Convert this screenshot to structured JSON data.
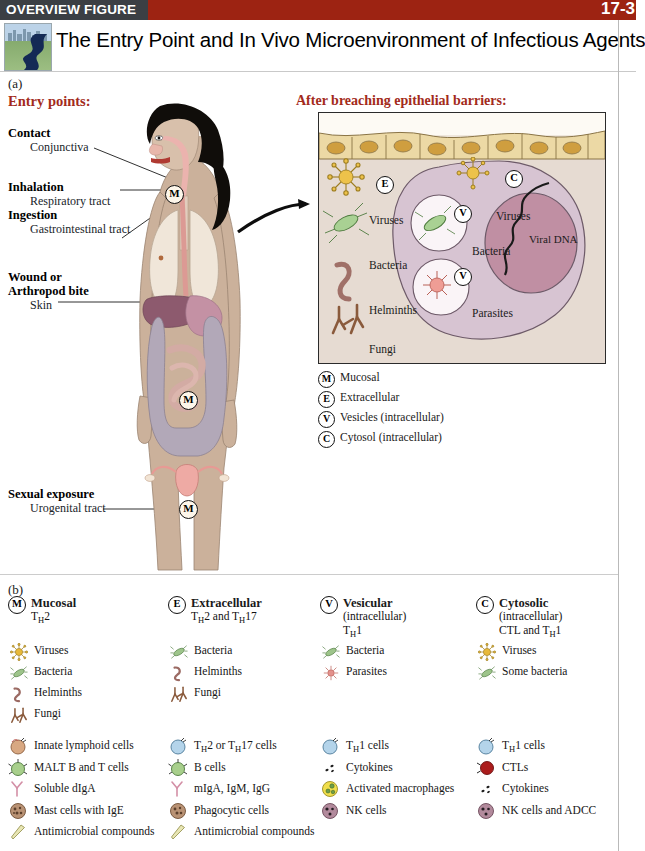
{
  "header": {
    "kicker": "OVERVIEW FIGURE",
    "page_number": "17-3",
    "title": "The Entry Point and In Vivo Microenvironment of Infectious Agents",
    "bar_color": "#9d2312",
    "kicker_block_color": "#3b3f44",
    "accent_red": "#a32b1b"
  },
  "panel_a": {
    "label": "(a)",
    "entry_heading": "Entry points:",
    "breach_heading": "After breaching epithelial barriers:",
    "entry_points": [
      {
        "bold": "Contact",
        "sub": "Conjunctiva"
      },
      {
        "bold": "Inhalation",
        "sub": "Respiratory tract"
      },
      {
        "bold": "Ingestion",
        "sub": "Gastrointestinal tract"
      },
      {
        "bold": "Wound or",
        "bold2": "Arthropod bite",
        "sub": "Skin"
      },
      {
        "bold": "Sexual exposure",
        "sub": "Urogenital tract"
      }
    ],
    "body_markers": [
      "M",
      "M",
      "M"
    ],
    "micrograph": {
      "extracellular_marker": "E",
      "cytosol_marker": "C",
      "vesicle_markers": [
        "V",
        "V"
      ],
      "extracellular_items": [
        "Viruses",
        "Bacteria",
        "Helminths",
        "Fungi"
      ],
      "cytosol_items": [
        "Viruses",
        "Viral DNA"
      ],
      "vesicle_items": [
        "Bacteria",
        "Parasites"
      ]
    },
    "key": [
      {
        "letter": "M",
        "text": "Mucosal"
      },
      {
        "letter": "E",
        "text": "Extracellular"
      },
      {
        "letter": "V",
        "text": "Vesicles (intracellular)"
      },
      {
        "letter": "C",
        "text": "Cytosol (intracellular)"
      }
    ]
  },
  "panel_b": {
    "label": "(b)",
    "columns": [
      {
        "letter": "M",
        "title": "Mucosal",
        "sub1": "Tₕ2",
        "sub2": "",
        "pathogens": [
          {
            "icon": "virus-icon",
            "label": "Viruses"
          },
          {
            "icon": "bacteria-icon",
            "label": "Bacteria"
          },
          {
            "icon": "helminth-icon",
            "label": "Helminths"
          },
          {
            "icon": "fungus-icon",
            "label": "Fungi"
          }
        ],
        "effectors": [
          {
            "icon": "innate-lymphoid-cell-icon",
            "label": "Innate lymphoid cells"
          },
          {
            "icon": "malt-cell-icon",
            "label": "MALT B and T cells"
          },
          {
            "icon": "antibody-icon",
            "label": "Soluble dIgA"
          },
          {
            "icon": "mast-cell-icon",
            "label": "Mast cells with IgE"
          },
          {
            "icon": "antimicrobial-icon",
            "label": "Antimicrobial compounds"
          }
        ]
      },
      {
        "letter": "E",
        "title": "Extracellular",
        "sub1": "Tₕ2 and Tₕ17",
        "sub2": "",
        "pathogens": [
          {
            "icon": "bacteria-icon",
            "label": "Bacteria"
          },
          {
            "icon": "helminth-icon",
            "label": "Helminths"
          },
          {
            "icon": "fungus-icon",
            "label": "Fungi"
          }
        ],
        "effectors": [
          {
            "icon": "t-cell-icon",
            "label": "Tₕ2 or Tₕ17 cells"
          },
          {
            "icon": "b-cell-icon",
            "label": "B cells"
          },
          {
            "icon": "antibody-icon",
            "label": "mIgA, IgM, IgG"
          },
          {
            "icon": "phagocyte-icon",
            "label": "Phagocytic cells"
          },
          {
            "icon": "antimicrobial-icon",
            "label": "Antimicrobial compounds"
          }
        ]
      },
      {
        "letter": "V",
        "title": "Vesicular",
        "sub1": "(intracellular)",
        "sub2": "Tₕ1",
        "pathogens": [
          {
            "icon": "bacteria-icon",
            "label": "Bacteria"
          },
          {
            "icon": "parasite-icon",
            "label": "Parasites"
          }
        ],
        "effectors": [
          {
            "icon": "t-cell-icon",
            "label": "Tₕ1 cells"
          },
          {
            "icon": "cytokine-icon",
            "label": "Cytokines"
          },
          {
            "icon": "macrophage-icon",
            "label": "Activated macrophages"
          },
          {
            "icon": "nk-cell-icon",
            "label": "NK cells"
          }
        ]
      },
      {
        "letter": "C",
        "title": "Cytosolic",
        "sub1": "(intracellular)",
        "sub2": "CTL and Tₕ1",
        "pathogens": [
          {
            "icon": "virus-icon",
            "label": "Viruses"
          },
          {
            "icon": "bacteria-icon",
            "label": "Some bacteria"
          }
        ],
        "effectors": [
          {
            "icon": "t-cell-icon",
            "label": "Tₕ1 cells"
          },
          {
            "icon": "ctl-icon",
            "label": "CTLs"
          },
          {
            "icon": "cytokine-icon",
            "label": "Cytokines"
          },
          {
            "icon": "nk-cell-icon",
            "label": "NK cells and ADCC"
          }
        ]
      }
    ]
  },
  "colors": {
    "virus": "#e8b93a",
    "bacteria": "#9dc48a",
    "helminth": "#9b6a63",
    "fungus": "#8a5a3c",
    "parasite": "#e3918c",
    "tissue": "#e6dbd2",
    "nucleus": "#c49cb0",
    "cell": "#d7c4d2",
    "epithelium": "#ecd9a5",
    "skin": "#cbb19b"
  }
}
